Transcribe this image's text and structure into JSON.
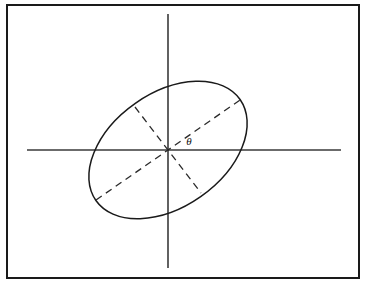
{
  "figure": {
    "canvas": {
      "width": 366,
      "height": 284,
      "background": "#ffffff"
    },
    "frame": {
      "name": "outer-border",
      "x": 7,
      "y": 5,
      "width": 352,
      "height": 273,
      "stroke": "#1a1a1a",
      "stroke_width": 2
    },
    "axes": {
      "origin": {
        "x": 168,
        "y": 150
      },
      "horizontal": {
        "x1": 27,
        "y1": 150,
        "x2": 341,
        "y2": 150,
        "stroke": "#3a3a3a"
      },
      "vertical": {
        "x1": 168,
        "y1": 14,
        "x2": 168,
        "y2": 268,
        "stroke": "#3a3a3a"
      }
    },
    "ellipse": {
      "cx": 168,
      "cy": 150,
      "rx": 88,
      "ry": 57,
      "rotation_deg": -35,
      "stroke": "#1a1a1a",
      "fill": "none"
    },
    "major_axis": {
      "label": "major-axis",
      "x1": 96,
      "y1": 200,
      "x2": 240,
      "y2": 100,
      "style": "dashed"
    },
    "minor_axis": {
      "label": "minor-axis",
      "x1": 135,
      "y1": 107,
      "x2": 201,
      "y2": 193,
      "style": "dashed"
    },
    "angle_annotation": {
      "symbol": "θ",
      "x": 189,
      "y": 142,
      "description": "rotation angle between positive x-axis and major axis"
    }
  },
  "chart_data": {
    "type": "scatter",
    "xlabel": "",
    "ylabel": "",
    "grid": false,
    "legend": "none",
    "annotations": [
      {
        "text": "θ",
        "x": 189,
        "y": 142
      }
    ],
    "shapes": [
      {
        "kind": "ellipse",
        "center": [
          168,
          150
        ],
        "semi_major": 88,
        "semi_minor": 57,
        "rotation_deg": -35,
        "stroke": "#1a1a1a",
        "dash": "solid"
      },
      {
        "kind": "line",
        "name": "x-axis",
        "from": [
          27,
          150
        ],
        "to": [
          341,
          150
        ],
        "dash": "solid"
      },
      {
        "kind": "line",
        "name": "y-axis",
        "from": [
          168,
          14
        ],
        "to": [
          168,
          268
        ],
        "dash": "solid"
      },
      {
        "kind": "line",
        "name": "major-axis",
        "from": [
          96,
          200
        ],
        "to": [
          240,
          100
        ],
        "dash": "dashed"
      },
      {
        "kind": "line",
        "name": "minor-axis",
        "from": [
          135,
          107
        ],
        "to": [
          201,
          193
        ],
        "dash": "dashed"
      }
    ]
  }
}
